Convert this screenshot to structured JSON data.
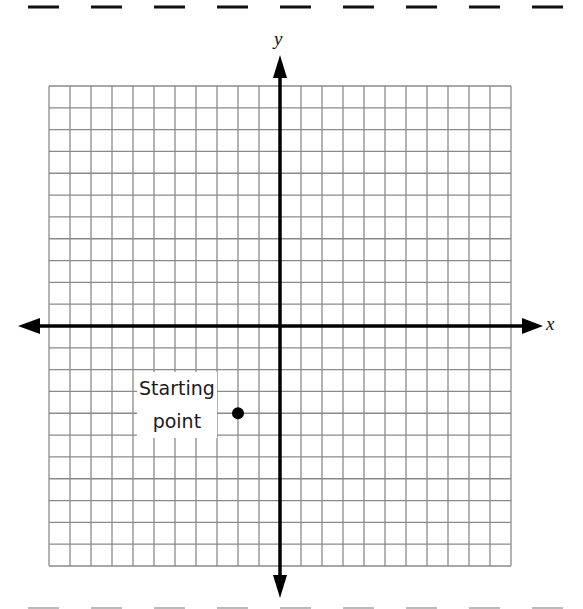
{
  "worksheet": {
    "top_cut_line": "dashed",
    "bottom_cut_line": "dashed"
  },
  "graph": {
    "x_axis_label": "x",
    "y_axis_label": "y",
    "grid": {
      "columns": 22,
      "rows": 22,
      "x_range": [
        -11,
        11
      ],
      "y_range": [
        -11,
        11
      ],
      "line_color": "#8a8a8a",
      "axis_color": "#000000"
    },
    "points": [
      {
        "label_line1": "Starting",
        "label_line2": "point",
        "x": -2,
        "y": -4
      }
    ]
  }
}
